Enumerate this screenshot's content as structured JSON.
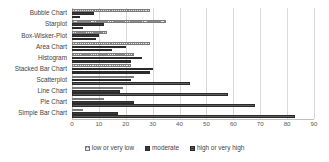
{
  "chart_data": {
    "type": "bar",
    "orientation": "horizontal",
    "title": "",
    "subtitle": "",
    "xlabel": "",
    "ylabel": "",
    "xlim": [
      0,
      90
    ],
    "xticks": [
      0,
      10,
      20,
      30,
      40,
      50,
      60,
      70,
      80,
      90
    ],
    "xtick_labels": [
      "0",
      "10",
      "20",
      "30",
      "40",
      "50",
      "60",
      "70",
      "80",
      "90"
    ],
    "grid": true,
    "grid_axis": "x",
    "legend_position": "bottom",
    "categories": [
      "Bubble Chart",
      "Starplot",
      "Box-Wisker-Plot",
      "Area Chart",
      "Histogram",
      "Stacked Bar Chart",
      "Scatterplot",
      "Line Chart",
      "Pie Chart",
      "Simple Bar Chart"
    ],
    "series": [
      {
        "name": "low or very low",
        "fill": "checkered-hatch",
        "color": "#e8e8e8",
        "values": [
          29,
          35,
          13,
          29,
          23,
          22,
          23,
          19,
          12,
          4
        ]
      },
      {
        "name": "moderate",
        "fill": "solid",
        "color": "#3a3a3a",
        "values": [
          8,
          12,
          10,
          20,
          26,
          30,
          22,
          18,
          23,
          17
        ]
      },
      {
        "name": "high or very high",
        "fill": "horizontal-hatch",
        "color": "#5c5c5c",
        "values": [
          3,
          4,
          9,
          15,
          22,
          29,
          44,
          58,
          68,
          83
        ]
      }
    ]
  },
  "legend": {
    "items": [
      {
        "label": "low or very low"
      },
      {
        "label": "moderate"
      },
      {
        "label": "high or very high"
      }
    ]
  },
  "colors": {
    "gridline": "#d9d9d9",
    "axis": "#bfbfbf",
    "text": "#3f3f3f",
    "tick_text": "#595959",
    "background": "#ffffff"
  }
}
